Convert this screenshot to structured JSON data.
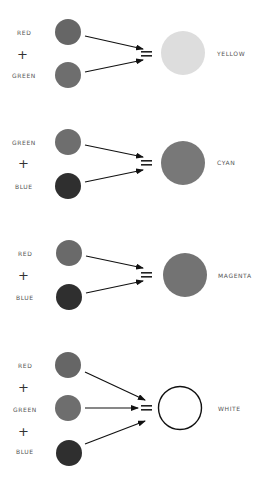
{
  "colors": {
    "red": "#666666",
    "green": "#6e6e6e",
    "blue": "#2f2f2f",
    "yellow": "#dddddd",
    "cyan": "#787878",
    "magenta": "#737373",
    "white": "#ffffff",
    "arrow": "#111111"
  },
  "equations": [
    {
      "inputs": [
        "RED",
        "GREEN"
      ],
      "operator": "+",
      "equals": "=",
      "result": "YELLOW"
    },
    {
      "inputs": [
        "GREEN",
        "BLUE"
      ],
      "operator": "+",
      "equals": "=",
      "result": "CYAN"
    },
    {
      "inputs": [
        "RED",
        "BLUE"
      ],
      "operator": "+",
      "equals": "=",
      "result": "MAGENTA"
    },
    {
      "inputs": [
        "RED",
        "GREEN",
        "BLUE"
      ],
      "operator": "+",
      "equals": "=",
      "result": "WHITE"
    }
  ]
}
